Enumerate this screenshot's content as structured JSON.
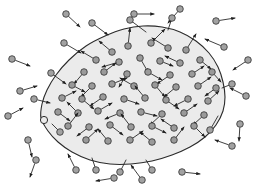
{
  "figure": {
    "type": "scientific-illustration",
    "width": 256,
    "height": 191,
    "background_color": "#ffffff"
  },
  "region": {
    "name": "shaded-blob-region",
    "fill_color": "#ebebeb",
    "stroke_color": "#2b2b2b",
    "stroke_width": 1.1,
    "outline_points": [
      [
        41,
        118
      ],
      [
        42,
        104
      ],
      [
        47,
        90
      ],
      [
        56,
        75
      ],
      [
        69,
        60
      ],
      [
        86,
        46
      ],
      [
        105,
        36
      ],
      [
        124,
        29
      ],
      [
        143,
        26
      ],
      [
        162,
        27
      ],
      [
        180,
        32
      ],
      [
        196,
        41
      ],
      [
        209,
        53
      ],
      [
        218,
        67
      ],
      [
        223,
        82
      ],
      [
        225,
        97
      ],
      [
        223,
        111
      ],
      [
        216,
        125
      ],
      [
        205,
        137
      ],
      [
        190,
        147
      ],
      [
        172,
        155
      ],
      [
        152,
        161
      ],
      [
        131,
        164
      ],
      [
        110,
        164
      ],
      [
        90,
        160
      ],
      [
        72,
        152
      ],
      [
        58,
        142
      ],
      [
        48,
        131
      ]
    ],
    "notch": {
      "name": "boundary-notch",
      "cx": 44,
      "cy": 120,
      "r": 3.6
    }
  },
  "particles": {
    "radius": 3.3,
    "fill_color": "#9a9a9a",
    "stroke_color": "#2e2e2e",
    "arrow_color": "#1f1f1f",
    "inside_count": 54,
    "outside_count": 22,
    "inside": [
      {
        "x": 128,
        "y": 46,
        "dx": 2,
        "dy": -18
      },
      {
        "x": 151,
        "y": 43,
        "dx": 14,
        "dy": -14
      },
      {
        "x": 168,
        "y": 48,
        "dx": -16,
        "dy": -10
      },
      {
        "x": 112,
        "y": 52,
        "dx": -13,
        "dy": -11
      },
      {
        "x": 186,
        "y": 50,
        "dx": 10,
        "dy": -16
      },
      {
        "x": 96,
        "y": 60,
        "dx": -15,
        "dy": -9
      },
      {
        "x": 119,
        "y": 62,
        "dx": -17,
        "dy": 5
      },
      {
        "x": 140,
        "y": 58,
        "dx": 8,
        "dy": 14
      },
      {
        "x": 160,
        "y": 61,
        "dx": 13,
        "dy": 5
      },
      {
        "x": 180,
        "y": 63,
        "dx": -15,
        "dy": -7
      },
      {
        "x": 200,
        "y": 60,
        "dx": 11,
        "dy": 9
      },
      {
        "x": 84,
        "y": 72,
        "dx": -10,
        "dy": 12
      },
      {
        "x": 104,
        "y": 72,
        "dx": 12,
        "dy": -9
      },
      {
        "x": 127,
        "y": 74,
        "dx": -8,
        "dy": 13
      },
      {
        "x": 148,
        "y": 72,
        "dx": 14,
        "dy": 8
      },
      {
        "x": 170,
        "y": 75,
        "dx": -13,
        "dy": 9
      },
      {
        "x": 192,
        "y": 74,
        "dx": 12,
        "dy": -8
      },
      {
        "x": 212,
        "y": 72,
        "dx": 9,
        "dy": 10
      },
      {
        "x": 72,
        "y": 85,
        "dx": 13,
        "dy": 7
      },
      {
        "x": 92,
        "y": 86,
        "dx": -11,
        "dy": 11
      },
      {
        "x": 112,
        "y": 84,
        "dx": 15,
        "dy": -6
      },
      {
        "x": 134,
        "y": 86,
        "dx": -14,
        "dy": -8
      },
      {
        "x": 155,
        "y": 85,
        "dx": 10,
        "dy": 12
      },
      {
        "x": 176,
        "y": 87,
        "dx": -12,
        "dy": 10
      },
      {
        "x": 198,
        "y": 86,
        "dx": 13,
        "dy": -9
      },
      {
        "x": 216,
        "y": 88,
        "dx": -11,
        "dy": 8
      },
      {
        "x": 62,
        "y": 98,
        "dx": 14,
        "dy": -7
      },
      {
        "x": 82,
        "y": 99,
        "dx": 12,
        "dy": 10
      },
      {
        "x": 103,
        "y": 97,
        "dx": -13,
        "dy": 9
      },
      {
        "x": 124,
        "y": 99,
        "dx": 15,
        "dy": 5
      },
      {
        "x": 145,
        "y": 98,
        "dx": -10,
        "dy": -12
      },
      {
        "x": 166,
        "y": 100,
        "dx": 13,
        "dy": 9
      },
      {
        "x": 188,
        "y": 99,
        "dx": -14,
        "dy": 7
      },
      {
        "x": 208,
        "y": 101,
        "dx": 11,
        "dy": -10
      },
      {
        "x": 58,
        "y": 112,
        "dx": 12,
        "dy": 9
      },
      {
        "x": 78,
        "y": 113,
        "dx": -11,
        "dy": -11
      },
      {
        "x": 98,
        "y": 111,
        "dx": 14,
        "dy": -8
      },
      {
        "x": 120,
        "y": 113,
        "dx": -15,
        "dy": 6
      },
      {
        "x": 141,
        "y": 112,
        "dx": 16,
        "dy": 4
      },
      {
        "x": 162,
        "y": 114,
        "dx": -12,
        "dy": 11
      },
      {
        "x": 184,
        "y": 113,
        "dx": 13,
        "dy": -9
      },
      {
        "x": 204,
        "y": 115,
        "dx": -11,
        "dy": 10
      },
      {
        "x": 68,
        "y": 126,
        "dx": 10,
        "dy": -13
      },
      {
        "x": 89,
        "y": 127,
        "dx": -12,
        "dy": 9
      },
      {
        "x": 110,
        "y": 125,
        "dx": 13,
        "dy": 10
      },
      {
        "x": 131,
        "y": 127,
        "dx": -10,
        "dy": -13
      },
      {
        "x": 152,
        "y": 126,
        "dx": 14,
        "dy": 7
      },
      {
        "x": 174,
        "y": 128,
        "dx": -13,
        "dy": -9
      },
      {
        "x": 194,
        "y": 126,
        "dx": 11,
        "dy": 11
      },
      {
        "x": 86,
        "y": 140,
        "dx": 12,
        "dy": -11
      },
      {
        "x": 108,
        "y": 141,
        "dx": -10,
        "dy": -12
      },
      {
        "x": 130,
        "y": 140,
        "dx": 13,
        "dy": -9
      },
      {
        "x": 152,
        "y": 142,
        "dx": -12,
        "dy": -10
      },
      {
        "x": 174,
        "y": 140,
        "dx": 10,
        "dy": -13
      }
    ],
    "outside": [
      {
        "x": 134,
        "y": 14,
        "dx": 20,
        "dy": 0
      },
      {
        "x": 216,
        "y": 21,
        "dx": 19,
        "dy": -3
      },
      {
        "x": 92,
        "y": 23,
        "dx": 16,
        "dy": 12
      },
      {
        "x": 64,
        "y": 43,
        "dx": 17,
        "dy": 10
      },
      {
        "x": 224,
        "y": 47,
        "dx": -19,
        "dy": -8
      },
      {
        "x": 180,
        "y": 9,
        "dx": -12,
        "dy": 14
      },
      {
        "x": 51,
        "y": 73,
        "dx": 15,
        "dy": 11
      },
      {
        "x": 12,
        "y": 59,
        "dx": 18,
        "dy": 7
      },
      {
        "x": 20,
        "y": 91,
        "dx": 17,
        "dy": -5
      },
      {
        "x": 34,
        "y": 99,
        "dx": 16,
        "dy": 4
      },
      {
        "x": 8,
        "y": 116,
        "dx": 15,
        "dy": -8
      },
      {
        "x": 36,
        "y": 160,
        "dx": -6,
        "dy": 17
      },
      {
        "x": 76,
        "y": 170,
        "dx": -8,
        "dy": -16
      },
      {
        "x": 142,
        "y": 180,
        "dx": -11,
        "dy": -15
      },
      {
        "x": 114,
        "y": 178,
        "dx": -18,
        "dy": 3
      },
      {
        "x": 182,
        "y": 172,
        "dx": 18,
        "dy": 2
      },
      {
        "x": 240,
        "y": 124,
        "dx": -1,
        "dy": 17
      },
      {
        "x": 246,
        "y": 96,
        "dx": -16,
        "dy": -8
      },
      {
        "x": 232,
        "y": 146,
        "dx": -17,
        "dy": -6
      },
      {
        "x": 28,
        "y": 140,
        "dx": 4,
        "dy": 17
      },
      {
        "x": 66,
        "y": 14,
        "dx": 14,
        "dy": 13
      },
      {
        "x": 248,
        "y": 60,
        "dx": -15,
        "dy": 10
      }
    ],
    "escaping": [
      {
        "x": 130,
        "y": 20,
        "bx": 146,
        "by": 32
      },
      {
        "x": 172,
        "y": 18,
        "bx": 168,
        "by": 30
      },
      {
        "x": 60,
        "y": 132,
        "bx": 52,
        "by": 124
      },
      {
        "x": 120,
        "y": 172,
        "bx": 126,
        "by": 160
      },
      {
        "x": 152,
        "y": 170,
        "bx": 146,
        "by": 160
      },
      {
        "x": 210,
        "y": 130,
        "bx": 218,
        "by": 116
      },
      {
        "x": 96,
        "y": 170,
        "bx": 92,
        "by": 158
      },
      {
        "x": 232,
        "y": 84,
        "bx": 222,
        "by": 88
      }
    ]
  },
  "legend": {
    "particle_label": "particle",
    "vector_label": "velocity vector",
    "region_label": "bounded region"
  }
}
